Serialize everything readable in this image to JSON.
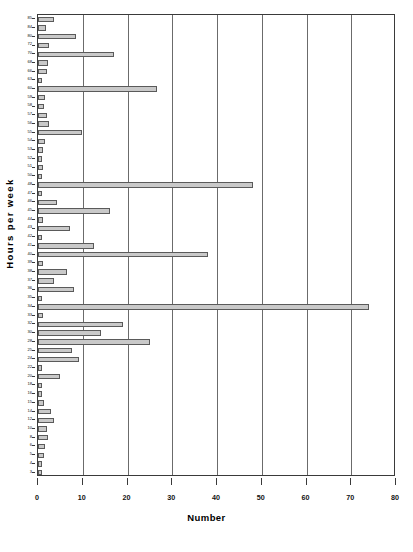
{
  "chart_data": {
    "type": "bar",
    "orientation": "horizontal",
    "title": "",
    "xlabel": "Number",
    "ylabel": "Hours per week",
    "xlim": [
      0,
      80
    ],
    "xticks": [
      0,
      10,
      20,
      30,
      40,
      50,
      60,
      70,
      80
    ],
    "grid": true,
    "legend": null,
    "bar_color": "#c9c9c9",
    "bar_edge_color": "#5a5a5a",
    "categories": [
      "85",
      "84",
      "80",
      "72",
      "70",
      "68",
      "66",
      "63",
      "60",
      "59",
      "58",
      "57",
      "56",
      "55",
      "54",
      "53",
      "52",
      "51",
      "50",
      "48",
      "47",
      "46",
      "45",
      "44",
      "43",
      "42",
      "41",
      "40",
      "39",
      "38",
      "37",
      "36",
      "35",
      "34",
      "33",
      "32",
      "30",
      "28",
      "25",
      "24",
      "22",
      "20",
      "18",
      "16",
      "15",
      "14",
      "12",
      "10",
      "8",
      "6",
      "5",
      "4",
      "3"
    ],
    "values": [
      3.5,
      1.8,
      8.5,
      2.4,
      17,
      2.3,
      2.0,
      0.9,
      26.5,
      1.5,
      1.3,
      2.1,
      2.5,
      9.8,
      1.5,
      1.2,
      1.0,
      1.1,
      1.0,
      48,
      0.8,
      4.2,
      16,
      1.2,
      7.2,
      1.0,
      12.5,
      38,
      1.1,
      6.5,
      3.5,
      8.0,
      1.0,
      74,
      1.2,
      19,
      14,
      25,
      7.5,
      9.2,
      1.0,
      5.0,
      1.0,
      0.8,
      1.4,
      3.0,
      3.6,
      1.9,
      2.3,
      1.5,
      1.3,
      1.0,
      0.8
    ]
  }
}
